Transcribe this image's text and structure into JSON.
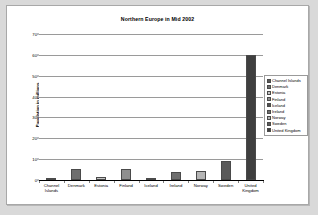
{
  "chart_data": {
    "type": "bar",
    "title": "Northern Europe in Mid 2002",
    "xlabel": "",
    "ylabel": "Population in millions",
    "categories": [
      "Channel Islands",
      "Denmark",
      "Estonia",
      "Finland",
      "Iceland",
      "Ireland",
      "Norway",
      "Sweden",
      "United Kingdom"
    ],
    "values": [
      0.15,
      5.4,
      1.4,
      5.2,
      0.3,
      3.9,
      4.5,
      8.9,
      60
    ],
    "ylim": [
      0,
      70
    ],
    "ytick_values": [
      0,
      10,
      20,
      30,
      40,
      50,
      60,
      70
    ],
    "ytick_labels": [
      "0",
      "10",
      "20",
      "30",
      "40",
      "50",
      "60",
      "70"
    ],
    "grid": true,
    "legend_position": "right",
    "legend_entries": [
      "Channel Islands",
      "Denmark",
      "Estonia",
      "Finland",
      "Iceland",
      "Ireland",
      "Norway",
      "Sweden",
      "United Kingdom"
    ],
    "series_colors": [
      "#595959",
      "#6e6e6e",
      "#c6c6c6",
      "#8f8f8f",
      "#4f4f4f",
      "#6e6e6e",
      "#b5b5b5",
      "#5a5a5a",
      "#3f3f3f"
    ]
  },
  "colors": {
    "page_background": "#d9d9d9",
    "plot_background": "#ffffff",
    "frame_border": "#a8a8a8",
    "gridline": "#9a9a9a",
    "axis": "#000000",
    "text": "#000000"
  }
}
